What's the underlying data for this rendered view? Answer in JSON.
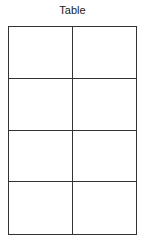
{
  "title": "Table",
  "table": {
    "rows": 4,
    "columns": 2,
    "cells": [
      [
        "",
        ""
      ],
      [
        "",
        ""
      ],
      [
        "",
        ""
      ],
      [
        "",
        ""
      ]
    ]
  }
}
